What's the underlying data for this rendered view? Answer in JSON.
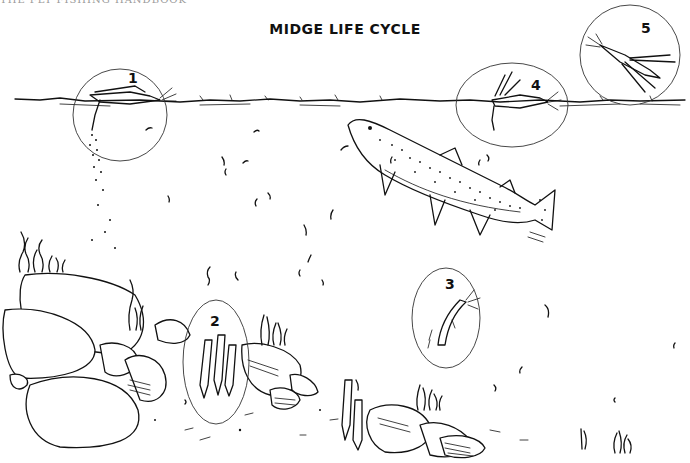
{
  "running_head": "THE FLY FISHING HANDBOOK",
  "title": "MIDGE LIFE CYCLE",
  "stages": [
    {
      "number": "1",
      "name": "egg-laying-adult",
      "shape": "circle",
      "cx": 120,
      "cy": 115,
      "rx": 47,
      "ry": 46
    },
    {
      "number": "2",
      "name": "larva",
      "shape": "ellipse",
      "cx": 216,
      "cy": 362,
      "rx": 33,
      "ry": 62
    },
    {
      "number": "3",
      "name": "pupa",
      "shape": "ellipse",
      "cx": 446,
      "cy": 318,
      "rx": 34,
      "ry": 50
    },
    {
      "number": "4",
      "name": "emerging-adult",
      "shape": "ellipse",
      "cx": 512,
      "cy": 105,
      "rx": 56,
      "ry": 42
    },
    {
      "number": "5",
      "name": "flying-adult",
      "shape": "circle",
      "cx": 630,
      "cy": 55,
      "rx": 50,
      "ry": 50
    }
  ],
  "scene": {
    "water_surface_y": 101,
    "elements": [
      "water-surface",
      "trout",
      "rocks",
      "aquatic-plants",
      "drifting-larvae"
    ]
  },
  "colors": {
    "ink": "#111111",
    "background": "#ffffff",
    "running_head": "#9a9a9a"
  }
}
